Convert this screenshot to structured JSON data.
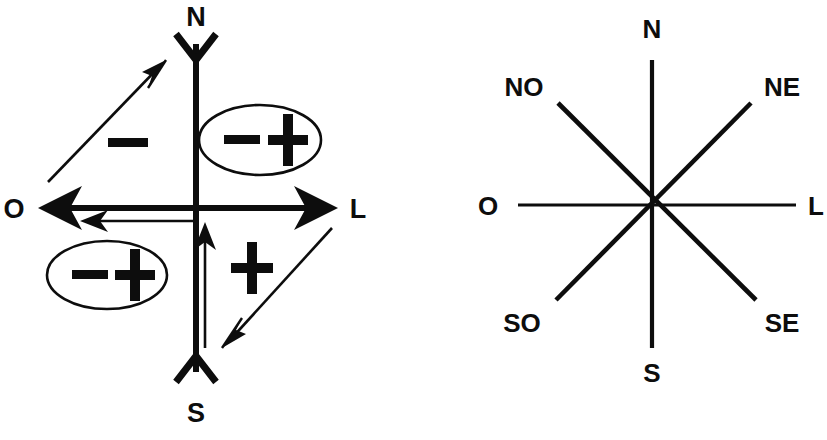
{
  "figure": {
    "title": "",
    "background_color": "#ffffff",
    "ink_color": "#0d0d0d",
    "panels": [
      {
        "id": "left-panel",
        "name": "cartesian-axes-with-sign-annotations",
        "center": {
          "x": 196,
          "y": 208
        },
        "axis_labels": {
          "north": "N",
          "south": "S",
          "west": "O",
          "east": "L"
        },
        "quadrant_signs": [
          {
            "quadrant": "II",
            "symbol": "−",
            "circled": false,
            "x": 128,
            "y": 144
          },
          {
            "quadrant": "I",
            "symbol": "−+",
            "circled": true,
            "x": 258,
            "y": 139
          },
          {
            "quadrant": "III",
            "symbol": "−+",
            "circled": true,
            "x": 104,
            "y": 275
          },
          {
            "quadrant": "IV",
            "symbol": "+",
            "circled": false,
            "x": 250,
            "y": 268
          }
        ],
        "arrows": [
          {
            "name": "diagonal-up-right-arrow",
            "from": [
              48,
              182
            ],
            "to": [
              164,
              62
            ],
            "weight": "thin"
          },
          {
            "name": "diagonal-down-left-arrow",
            "from": [
              330,
              230
            ],
            "to": [
              222,
              348
            ],
            "weight": "thin"
          },
          {
            "name": "vertical-up-arrow",
            "from": [
              204,
              345
            ],
            "to": [
              204,
              222
            ],
            "weight": "thin"
          },
          {
            "name": "horizontal-left-arrow",
            "from": [
              196,
              220
            ],
            "to": [
              82,
              220
            ],
            "weight": "thin"
          }
        ]
      },
      {
        "id": "right-panel",
        "name": "compass-rose-eight-directions",
        "center": {
          "x": 232,
          "y": 205
        },
        "directions": [
          {
            "key": "N",
            "label": "N",
            "angle_deg": 90,
            "label_x": 232,
            "label_y": 30
          },
          {
            "key": "NE",
            "label": "NE",
            "angle_deg": 45,
            "label_x": 364,
            "label_y": 92
          },
          {
            "key": "L",
            "label": "L",
            "angle_deg": 0,
            "label_x": 398,
            "label_y": 214
          },
          {
            "key": "SE",
            "label": "SE",
            "angle_deg": -45,
            "label_x": 362,
            "label_y": 328
          },
          {
            "key": "S",
            "label": "S",
            "angle_deg": -90,
            "label_x": 232,
            "label_y": 380
          },
          {
            "key": "SO",
            "label": "SO",
            "angle_deg": -135,
            "label_x": 102,
            "label_y": 330
          },
          {
            "key": "O",
            "label": "O",
            "angle_deg": 180,
            "label_x": 68,
            "label_y": 214
          },
          {
            "key": "NO",
            "label": "NO",
            "angle_deg": 135,
            "label_x": 103,
            "label_y": 92
          }
        ]
      }
    ]
  }
}
